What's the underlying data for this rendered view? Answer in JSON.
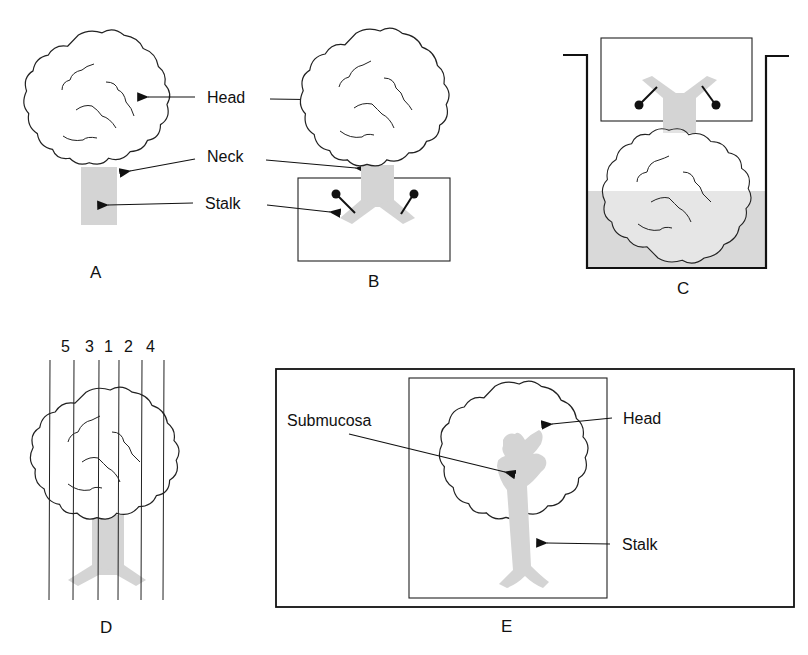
{
  "figure": {
    "panels": [
      {
        "id": "A",
        "label": "A",
        "description": "Pedunculated polyp with head, neck and stalk"
      },
      {
        "id": "B",
        "label": "B",
        "description": "Polyp pinned by stalk to a block"
      },
      {
        "id": "C",
        "label": "C",
        "description": "Pinned polyp inverted and immersed in fixative container"
      },
      {
        "id": "D",
        "label": "D",
        "description": "Parallel sectioning lines through polyp"
      },
      {
        "id": "E",
        "label": "E",
        "description": "Central section showing submucosa"
      }
    ],
    "annotations": {
      "head": "Head",
      "neck": "Neck",
      "stalk": "Stalk",
      "submucosa": "Submucosa",
      "head_e": "Head",
      "stalk_e": "Stalk"
    },
    "section_numbers": [
      "5",
      "3",
      "1",
      "2",
      "4"
    ],
    "colors": {
      "line": "#222222",
      "stalk_fill": "#d4d4d4",
      "fixative_fill": "#d9d9d9",
      "background": "#ffffff"
    }
  }
}
